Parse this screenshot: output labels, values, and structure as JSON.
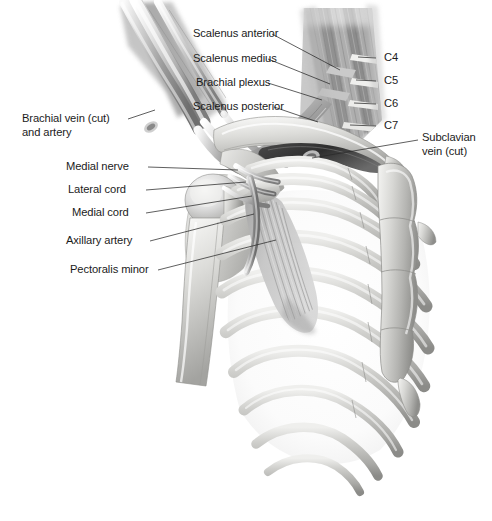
{
  "figure": {
    "background_color": "#ffffff",
    "text_color": "#1b1b1b",
    "leader_line_color": "#2a2a2a",
    "width": 492,
    "height": 521
  },
  "labels": {
    "scalenus_anterior": "Scalenus anterior",
    "scalenus_medius": "Scalenus medius",
    "brachial_plexus": "Brachial plexus",
    "scalenus_posterior": "Scalenus posterior",
    "brachial_vein_line1": "Brachial vein (cut)",
    "brachial_vein_line2": "and artery",
    "medial_nerve": "Medial nerve",
    "lateral_cord": "Lateral cord",
    "medial_cord": "Medial cord",
    "axillary_artery": "Axillary artery",
    "pectoralis_minor": "Pectoralis minor",
    "subclavian_vein_line1": "Subclavian",
    "subclavian_vein_line2": "vein (cut)"
  },
  "nerve_roots": {
    "c4": "C4",
    "c5": "C5",
    "c6": "C6",
    "c7": "C7"
  },
  "structures": {
    "clavicle": "clavicle",
    "sternum": "sternum",
    "ribs": "ribcage",
    "humerus": "humerus",
    "scapula": "scapula",
    "xiphoid": "xiphoid-process"
  }
}
